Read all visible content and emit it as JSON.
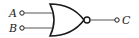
{
  "diagram": {
    "type": "logic-gate",
    "gate": "NOR",
    "inputs": [
      {
        "label": "A"
      },
      {
        "label": "B"
      }
    ],
    "output": {
      "label": "C"
    },
    "colors": {
      "stroke": "#1a1a1a",
      "wire": "#555555",
      "text": "#222222",
      "background": "#ffffff"
    }
  }
}
